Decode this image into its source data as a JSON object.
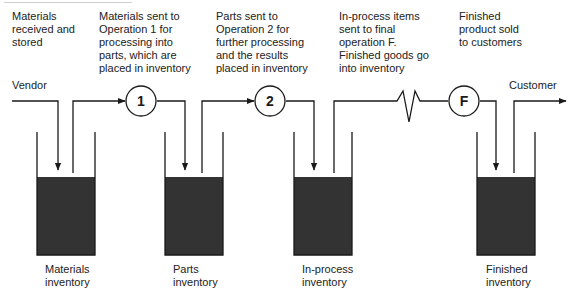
{
  "descriptions": [
    {
      "id": "materials",
      "text": "Materials\nreceived and\nstored"
    },
    {
      "id": "op1",
      "text": "Materials sent to\nOperation 1 for\nprocessing into\nparts, which are\nplaced in inventory"
    },
    {
      "id": "op2",
      "text": "Parts sent to\nOperation 2 for\nfurther processing\nand the results\nplaced in inventory"
    },
    {
      "id": "final",
      "text": "In-process items\nsent to final\noperation F.\nFinished goods go\ninto inventory"
    },
    {
      "id": "finished",
      "text": "Finished\nproduct sold\nto customers"
    }
  ],
  "endpoints": {
    "source": "Vendor",
    "sink": "Customer"
  },
  "operations": [
    {
      "id": "op1",
      "label": "1"
    },
    {
      "id": "op2",
      "label": "2"
    },
    {
      "id": "opF",
      "label": "F"
    }
  ],
  "inventories": [
    {
      "id": "materials",
      "label": "Materials\ninventory"
    },
    {
      "id": "parts",
      "label": "Parts\ninventory"
    },
    {
      "id": "in-process",
      "label": "In-process\ninventory"
    },
    {
      "id": "finished",
      "label": "Finished\ninventory"
    }
  ],
  "colors": {
    "line": "#1a1a1a",
    "tank_fill": "#333333",
    "text": "#222222"
  }
}
